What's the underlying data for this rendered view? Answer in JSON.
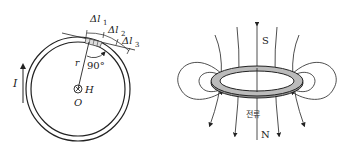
{
  "left_figure": {
    "current_label": "I",
    "radius_label": "r",
    "angle_label": "90°",
    "center_label": "O",
    "field_label": "H",
    "segments": [
      {
        "label": "Δl",
        "sub": "1"
      },
      {
        "label": "Δl",
        "sub": "2"
      },
      {
        "label": "Δl",
        "sub": "3"
      }
    ]
  },
  "right_figure": {
    "top_pole": "S",
    "bottom_pole": "N",
    "current_label": "전류"
  }
}
